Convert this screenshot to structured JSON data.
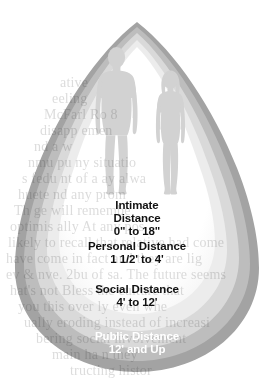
{
  "diagram": {
    "shape": "teardrop-concentric-zones",
    "figures": [
      {
        "name": "male-silhouette",
        "position": "left"
      },
      {
        "name": "female-silhouette",
        "position": "right"
      }
    ],
    "zones": [
      {
        "id": "intimate",
        "name": "Intimate Distance",
        "range": "0\" to 18\"",
        "label": "Intimate\nDistance\n0\" to 18\"",
        "fill": "#ffffff",
        "text_color": "#111111"
      },
      {
        "id": "personal",
        "name": "Personal Distance",
        "range": "1 1/2' to 4'",
        "label": "Personal Distance\n1 1/2' to 4'",
        "fill": "#e4e4e4",
        "text_color": "#111111"
      },
      {
        "id": "social",
        "name": "Social Distance",
        "range": "4' to 12'",
        "label": "Social Distance\n4' to 12'",
        "fill": "#cfcfcf",
        "text_color": "#111111"
      },
      {
        "id": "public",
        "name": "Public Distance",
        "range": "12' and Up",
        "label": "Public Distance\n12' and Up",
        "fill": "#a8a8a8",
        "text_color": "#ffffff"
      },
      {
        "id": "outer",
        "name": "Outer Ring",
        "range": "",
        "label": "",
        "fill": "#999999",
        "text_color": "#ffffff"
      }
    ],
    "colors": {
      "background": "#ffffff",
      "silhouette": "#d2d2d2",
      "band_1_white": "#ffffff",
      "band_2_lightest": "#ececec",
      "band_3_light": "#d9d9d9",
      "band_4_medium": "#bdbdbd",
      "band_5_dark": "#a3a3a3",
      "ghost_text": "#8a8a8a"
    }
  },
  "background_text": {
    "note": "faint page text bleeding through the figure",
    "lines": [
      "ative",
      "eeling",
      "McFarl        Ro        8",
      "disapp        emen",
      "nd a                     w",
      "nmu         pu       ny situatio",
      "s fedu        nt of a       ay alwa",
      "huete                       nd any prom",
      "Th ge                        will remembe",
      "optimis      ally                 At any pos",
      "likely to recall that relative had come",
      "have come in fact and they are lig",
      "ev & nve. 2bu of sa. The future seems",
      "hat's not Bless the culture that",
      "you this over        ly even  whe",
      "ually eroding instead of increasi",
      "bering social involvement",
      "main ha        n they",
      "tructing histor"
    ]
  }
}
